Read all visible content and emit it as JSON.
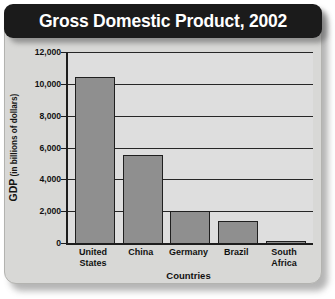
{
  "chart_data": {
    "type": "bar",
    "title": "Gross Domestic Product, 2002",
    "xlabel": "Countries",
    "ylabel": "GDP (in billions of dollars)",
    "ylabel_main": "GDP",
    "ylabel_sub": " (in billions of dollars)",
    "categories": [
      "United States",
      "China",
      "Germany",
      "Brazil",
      "South Africa"
    ],
    "category_lines": [
      [
        "United",
        "States"
      ],
      [
        "China"
      ],
      [
        "Germany"
      ],
      [
        "Brazil"
      ],
      [
        "South Africa"
      ]
    ],
    "values": [
      10400,
      5500,
      2000,
      1400,
      110
    ],
    "ylim": [
      0,
      12000
    ],
    "ytick_values": [
      0,
      2000,
      4000,
      6000,
      8000,
      10000,
      12000
    ],
    "ytick_labels": [
      "0",
      "2,000",
      "4,000",
      "6,000",
      "8,000",
      "10,000",
      "12,000"
    ],
    "grid": true,
    "legend": false,
    "colors": {
      "bar_fill": "#8f8f8f",
      "bar_border": "#1f1f1f",
      "plot_background": "#dedede",
      "panel_background": "#d8d8d6",
      "title_banner": "#1b1b1b",
      "title_text": "#ffffff",
      "axis": "#1d1d1d"
    }
  }
}
